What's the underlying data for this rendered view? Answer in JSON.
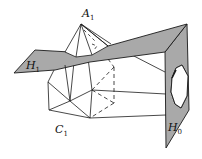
{
  "figure": {
    "colors": {
      "plane_fill": "#a9a9a9",
      "line": "#1a1a1a",
      "background": "#ffffff"
    },
    "labels": {
      "apex": {
        "main": "A",
        "sub": "1"
      },
      "upper_plane": {
        "main": "H",
        "sub": "1"
      },
      "lower_vertex": {
        "main": "C",
        "sub": "1"
      },
      "side_plane": {
        "main": "H",
        "sub": "0"
      }
    }
  }
}
